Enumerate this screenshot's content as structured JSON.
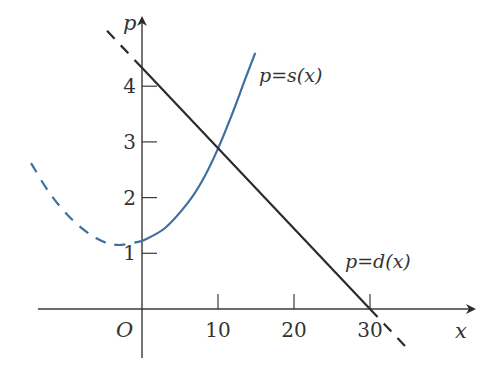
{
  "chart_data": {
    "type": "line",
    "title": "",
    "xlabel": "x",
    "ylabel": "p",
    "origin_label": "O",
    "x_ticks": [
      10,
      20,
      30
    ],
    "y_ticks": [
      1,
      2,
      3,
      4
    ],
    "x_tick_labels": [
      "10",
      "20",
      "30"
    ],
    "y_tick_labels": [
      "1",
      "2",
      "3",
      "4"
    ],
    "xlim": [
      -14,
      44
    ],
    "ylim": [
      -0.9,
      5.3
    ],
    "grid": false,
    "legend": "none",
    "series": [
      {
        "name": "p=d(x)",
        "label_parts": [
          "p",
          "=",
          "d",
          "(",
          "x",
          ")"
        ],
        "label_text": "p=d(x)",
        "kind": "linear",
        "color": "#2b2b2b",
        "solid_domain": [
          0,
          30
        ],
        "dashed_domains": [
          [
            -4.6,
            0
          ],
          [
            30,
            34.6
          ]
        ],
        "points": [
          {
            "x": -4.6,
            "y": 4.99
          },
          {
            "x": 0,
            "y": 4.33
          },
          {
            "x": 10,
            "y": 2.88
          },
          {
            "x": 20,
            "y": 1.44
          },
          {
            "x": 30,
            "y": 0
          },
          {
            "x": 34.6,
            "y": -0.66
          }
        ]
      },
      {
        "name": "p=s(x)",
        "label_text": "p=s(x)",
        "kind": "parabola",
        "color": "#3f6f9e",
        "solid_domain": [
          0,
          14.9
        ],
        "dashed_domains": [
          [
            -14.6,
            0
          ]
        ],
        "points": [
          {
            "x": -14.6,
            "y": 2.62
          },
          {
            "x": -12,
            "y": 2.05
          },
          {
            "x": -9,
            "y": 1.58
          },
          {
            "x": -6,
            "y": 1.27
          },
          {
            "x": -3.3,
            "y": 1.15
          },
          {
            "x": 0,
            "y": 1.22
          },
          {
            "x": 3,
            "y": 1.45
          },
          {
            "x": 6,
            "y": 1.9
          },
          {
            "x": 8,
            "y": 2.32
          },
          {
            "x": 10,
            "y": 2.88
          },
          {
            "x": 12,
            "y": 3.55
          },
          {
            "x": 13.5,
            "y": 4.1
          },
          {
            "x": 14.9,
            "y": 4.6
          }
        ]
      }
    ],
    "annotations": [
      {
        "text": "p=s(x)",
        "near": {
          "x": 15.5,
          "y": 4.35
        }
      },
      {
        "text": "p=d(x)",
        "near": {
          "x": 26,
          "y": 0.8
        }
      },
      {
        "text": "intersection",
        "at": {
          "x": 10,
          "y": 2.88
        }
      }
    ]
  }
}
